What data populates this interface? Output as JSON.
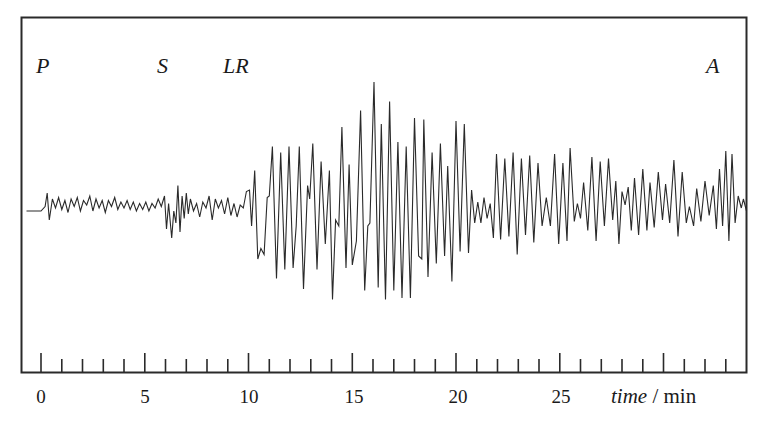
{
  "chart_data": {
    "type": "line",
    "title": "",
    "subtitle": "",
    "xlabel": "time / min",
    "xlabel_italic_part": "time",
    "xlabel_unit_part": " / min",
    "ylabel": "",
    "xlim": [
      -1,
      34
    ],
    "x_ticks_major": [
      0,
      5,
      10,
      15,
      20,
      25
    ],
    "x_tick_labels": [
      "0",
      "5",
      "10",
      "15",
      "20",
      "25"
    ],
    "x_ticks_minor_step": 1,
    "x_ticks_minor_max": 33,
    "grid": false,
    "legend": null,
    "y_axis_visible": false,
    "annotations": [
      {
        "label": "P",
        "description": "P-wave (primary) arrival",
        "time_min": 0
      },
      {
        "label": "S",
        "description": "S-wave (secondary) arrival",
        "time_min": 6
      },
      {
        "label": "LR",
        "description": "Long / Rayleigh surface wave arrival",
        "time_min": 9.5
      },
      {
        "label": "A",
        "description": "",
        "time_min": 32
      }
    ],
    "series": [
      {
        "name": "seismogram trace",
        "description": "Relative ground displacement (arbitrary units, +up) vs time in minutes; approximate trace vertices",
        "units": "relative amplitude (-1..1 of max)",
        "points": [
          [
            -0.7,
            0
          ],
          [
            0.0,
            0
          ],
          [
            0.2,
            0.03
          ],
          [
            0.3,
            0.12
          ],
          [
            0.4,
            -0.06
          ],
          [
            0.55,
            0.08
          ],
          [
            0.7,
            0.02
          ],
          [
            0.85,
            0.09
          ],
          [
            1.0,
            0.01
          ],
          [
            1.15,
            0.07
          ],
          [
            1.3,
            -0.01
          ],
          [
            1.45,
            0.08
          ],
          [
            1.6,
            0.03
          ],
          [
            1.75,
            0.09
          ],
          [
            1.9,
            0.0
          ],
          [
            2.05,
            0.07
          ],
          [
            2.2,
            0.04
          ],
          [
            2.35,
            0.1
          ],
          [
            2.5,
            0.0
          ],
          [
            2.65,
            0.08
          ],
          [
            2.8,
            0.02
          ],
          [
            2.95,
            0.07
          ],
          [
            3.1,
            -0.01
          ],
          [
            3.25,
            0.07
          ],
          [
            3.4,
            0.03
          ],
          [
            3.55,
            0.09
          ],
          [
            3.7,
            0.01
          ],
          [
            3.85,
            0.06
          ],
          [
            4.0,
            0.02
          ],
          [
            4.15,
            0.07
          ],
          [
            4.3,
            0.01
          ],
          [
            4.45,
            0.06
          ],
          [
            4.6,
            0.0
          ],
          [
            4.75,
            0.05
          ],
          [
            4.9,
            0.01
          ],
          [
            5.05,
            0.06
          ],
          [
            5.2,
            0.0
          ],
          [
            5.35,
            0.05
          ],
          [
            5.5,
            0.02
          ],
          [
            5.65,
            0.08
          ],
          [
            5.8,
            0.03
          ],
          [
            5.95,
            0.1
          ],
          [
            6.05,
            -0.12
          ],
          [
            6.15,
            0.05
          ],
          [
            6.3,
            -0.18
          ],
          [
            6.4,
            0.0
          ],
          [
            6.5,
            -0.08
          ],
          [
            6.6,
            0.17
          ],
          [
            6.7,
            -0.14
          ],
          [
            6.8,
            0.1
          ],
          [
            6.9,
            -0.05
          ],
          [
            7.0,
            0.12
          ],
          [
            7.1,
            -0.02
          ],
          [
            7.2,
            0.08
          ],
          [
            7.35,
            0.0
          ],
          [
            7.5,
            0.05
          ],
          [
            7.65,
            -0.04
          ],
          [
            7.8,
            0.06
          ],
          [
            7.95,
            0.02
          ],
          [
            8.1,
            0.1
          ],
          [
            8.25,
            -0.06
          ],
          [
            8.4,
            0.08
          ],
          [
            8.55,
            0.02
          ],
          [
            8.7,
            0.07
          ],
          [
            8.85,
            -0.02
          ],
          [
            9.0,
            0.09
          ],
          [
            9.15,
            -0.03
          ],
          [
            9.3,
            0.05
          ],
          [
            9.45,
            -0.04
          ],
          [
            9.6,
            0.04
          ],
          [
            9.75,
            0.02
          ],
          [
            9.9,
            0.13
          ],
          [
            10.05,
            0.14
          ],
          [
            10.15,
            -0.1
          ],
          [
            10.3,
            0.27
          ],
          [
            10.45,
            -0.32
          ],
          [
            10.6,
            -0.25
          ],
          [
            10.75,
            -0.29
          ],
          [
            10.9,
            0.09
          ],
          [
            11.0,
            0.1
          ],
          [
            11.15,
            0.43
          ],
          [
            11.35,
            -0.45
          ],
          [
            11.55,
            0.39
          ],
          [
            11.75,
            -0.39
          ],
          [
            11.95,
            0.43
          ],
          [
            12.15,
            -0.38
          ],
          [
            12.3,
            -0.1
          ],
          [
            12.45,
            0.43
          ],
          [
            12.65,
            -0.52
          ],
          [
            12.85,
            0.17
          ],
          [
            12.95,
            0.08
          ],
          [
            13.1,
            0.45
          ],
          [
            13.3,
            -0.39
          ],
          [
            13.5,
            0.33
          ],
          [
            13.7,
            -0.22
          ],
          [
            13.9,
            0.27
          ],
          [
            14.05,
            -0.59
          ],
          [
            14.2,
            -0.06
          ],
          [
            14.35,
            -0.1
          ],
          [
            14.5,
            0.56
          ],
          [
            14.7,
            -0.38
          ],
          [
            14.85,
            0.31
          ],
          [
            15.0,
            -0.36
          ],
          [
            15.2,
            -0.2
          ],
          [
            15.4,
            0.67
          ],
          [
            15.6,
            -0.53
          ],
          [
            15.75,
            -0.1
          ],
          [
            15.85,
            -0.08
          ],
          [
            16.05,
            0.86
          ],
          [
            16.25,
            -0.51
          ],
          [
            16.4,
            0.58
          ],
          [
            16.6,
            -0.59
          ],
          [
            16.8,
            0.73
          ],
          [
            17.0,
            -0.53
          ],
          [
            17.2,
            0.46
          ],
          [
            17.4,
            -0.58
          ],
          [
            17.6,
            0.43
          ],
          [
            17.8,
            -0.58
          ],
          [
            18.0,
            0.62
          ],
          [
            18.2,
            -0.3
          ],
          [
            18.35,
            -0.32
          ],
          [
            18.45,
            0.61
          ],
          [
            18.65,
            -0.44
          ],
          [
            18.85,
            0.39
          ],
          [
            19.05,
            -0.35
          ],
          [
            19.25,
            0.45
          ],
          [
            19.45,
            -0.3
          ],
          [
            19.6,
            0.3
          ],
          [
            19.8,
            -0.47
          ],
          [
            20.0,
            0.6
          ],
          [
            20.2,
            -0.27
          ],
          [
            20.4,
            0.58
          ],
          [
            20.6,
            -0.28
          ],
          [
            20.75,
            0.14
          ],
          [
            20.9,
            -0.08
          ],
          [
            21.05,
            0.06
          ],
          [
            21.2,
            -0.08
          ],
          [
            21.35,
            0.09
          ],
          [
            21.5,
            -0.05
          ],
          [
            21.65,
            0.05
          ],
          [
            21.8,
            -0.18
          ],
          [
            21.95,
            0.38
          ],
          [
            22.15,
            -0.19
          ],
          [
            22.35,
            0.35
          ],
          [
            22.55,
            -0.17
          ],
          [
            22.75,
            0.39
          ],
          [
            22.95,
            -0.29
          ],
          [
            23.15,
            0.35
          ],
          [
            23.35,
            -0.16
          ],
          [
            23.55,
            0.37
          ],
          [
            23.75,
            -0.21
          ],
          [
            23.95,
            0.32
          ],
          [
            24.15,
            -0.1
          ],
          [
            24.35,
            0.09
          ],
          [
            24.55,
            -0.1
          ],
          [
            24.75,
            0.38
          ],
          [
            24.95,
            -0.22
          ],
          [
            25.15,
            0.32
          ],
          [
            25.35,
            -0.2
          ],
          [
            25.5,
            0.42
          ],
          [
            25.7,
            -0.07
          ],
          [
            25.85,
            0.05
          ],
          [
            26.0,
            -0.05
          ],
          [
            26.15,
            0.19
          ],
          [
            26.35,
            -0.13
          ],
          [
            26.55,
            0.36
          ],
          [
            26.75,
            -0.2
          ],
          [
            26.95,
            0.33
          ],
          [
            27.15,
            -0.1
          ],
          [
            27.35,
            0.35
          ],
          [
            27.55,
            -0.06
          ],
          [
            27.7,
            0.2
          ],
          [
            27.85,
            -0.22
          ],
          [
            28.0,
            0.13
          ],
          [
            28.15,
            0.04
          ],
          [
            28.3,
            0.16
          ],
          [
            28.45,
            -0.13
          ],
          [
            28.6,
            0.22
          ],
          [
            28.8,
            -0.16
          ],
          [
            29.0,
            0.28
          ],
          [
            29.2,
            -0.13
          ],
          [
            29.35,
            0.19
          ],
          [
            29.55,
            -0.11
          ],
          [
            29.75,
            0.26
          ],
          [
            29.95,
            -0.06
          ],
          [
            30.1,
            0.18
          ],
          [
            30.3,
            -0.08
          ],
          [
            30.5,
            0.34
          ],
          [
            30.7,
            -0.17
          ],
          [
            30.9,
            0.26
          ],
          [
            31.1,
            -0.08
          ],
          [
            31.25,
            0.03
          ],
          [
            31.45,
            -0.1
          ],
          [
            31.6,
            0.15
          ],
          [
            31.8,
            -0.07
          ],
          [
            32.0,
            0.2
          ],
          [
            32.2,
            -0.03
          ],
          [
            32.4,
            0.17
          ],
          [
            32.55,
            -0.12
          ],
          [
            32.7,
            0.28
          ],
          [
            32.85,
            -0.1
          ],
          [
            33.0,
            0.4
          ],
          [
            33.15,
            -0.2
          ],
          [
            33.3,
            0.38
          ],
          [
            33.45,
            -0.08
          ],
          [
            33.6,
            0.1
          ],
          [
            33.75,
            0.02
          ],
          [
            33.85,
            0.08
          ],
          [
            34.0,
            0.0
          ]
        ]
      }
    ]
  },
  "labels": {
    "p_wave": "P",
    "s_wave": "S",
    "lr_wave": "LR",
    "a_marker": "A",
    "tick_0": "0",
    "tick_5": "5",
    "tick_10": "10",
    "tick_15": "15",
    "tick_20": "20",
    "tick_25": "25",
    "axis_time": "time",
    "axis_unit": " / min"
  },
  "style": {
    "line_color": "#2a2a2a",
    "frame_color": "#2a2a2a",
    "background": "#ffffff"
  }
}
